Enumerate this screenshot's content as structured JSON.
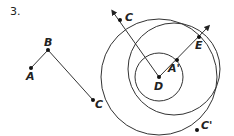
{
  "problem_number": "3.",
  "points": {
    "A": {
      "label": "A",
      "x": 31,
      "y": 68
    },
    "B": {
      "label": "B",
      "x": 48,
      "y": 50
    },
    "C_left": {
      "label": "C",
      "x": 93,
      "y": 100
    },
    "C_top": {
      "label": "C",
      "x": 120,
      "y": 20
    },
    "D": {
      "label": "D",
      "x": 159,
      "y": 77
    },
    "A_prime": {
      "label": "A'",
      "x": 177,
      "y": 60
    },
    "E": {
      "label": "E",
      "x": 199,
      "y": 37
    },
    "C_prime": {
      "label": "C'",
      "x": 197,
      "y": 130
    }
  },
  "circles": [
    {
      "cx": 159,
      "cy": 77,
      "r": 24
    },
    {
      "cx": 159,
      "cy": 77,
      "r": 58
    },
    {
      "cx": 174,
      "cy": 69,
      "r": 46
    }
  ]
}
